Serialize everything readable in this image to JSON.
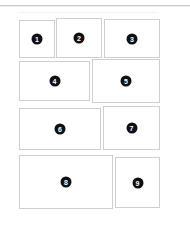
{
  "canvas": {
    "width": 190,
    "height": 225,
    "background_color": "#ffffff",
    "border_color": "#cfcfcf",
    "badge_color": "#101010",
    "badge_text_color": "#ffffff",
    "rule_color": "#c9c9c9"
  },
  "layout": {
    "name": "photo-grid-template",
    "cell_count": 9,
    "row_count": 4
  },
  "cells": [
    {
      "label": "1",
      "x": 19,
      "y": 20,
      "w": 36,
      "h": 38
    },
    {
      "label": "2",
      "x": 56,
      "y": 18,
      "w": 46,
      "h": 40
    },
    {
      "label": "3",
      "x": 104,
      "y": 19,
      "w": 56,
      "h": 39
    },
    {
      "label": "4",
      "x": 19,
      "y": 61,
      "w": 71,
      "h": 40
    },
    {
      "label": "5",
      "x": 92,
      "y": 59,
      "w": 68,
      "h": 44
    },
    {
      "label": "6",
      "x": 19,
      "y": 108,
      "w": 82,
      "h": 42
    },
    {
      "label": "7",
      "x": 103,
      "y": 106,
      "w": 57,
      "h": 44
    },
    {
      "label": "8",
      "x": 19,
      "y": 155,
      "w": 94,
      "h": 54
    },
    {
      "label": "9",
      "x": 115,
      "y": 157,
      "w": 45,
      "h": 51
    }
  ]
}
